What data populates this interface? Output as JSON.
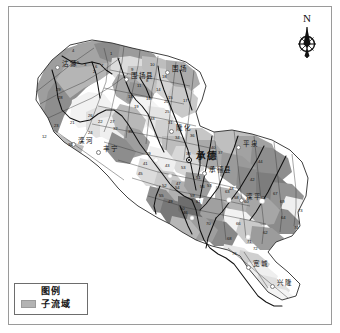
{
  "map": {
    "title_visible": false,
    "north_arrow": {
      "letter": "N",
      "icon": "compass-north-icon"
    },
    "legend": {
      "title": "图例",
      "items": [
        {
          "label": "子流域",
          "color": "#b3b3b3"
        }
      ]
    },
    "colors": {
      "frame": "#9a9a9a",
      "basin_outline": "#2b2b2b",
      "river": "#1a1a1a",
      "fill_lightest": "#ffffff",
      "fill_light": "#e2e2e2",
      "fill_mid": "#c4c4c4",
      "fill_dark": "#a6a6a6",
      "fill_darkest": "#8a8a8a"
    },
    "places": [
      {
        "name": "承德",
        "type": "city",
        "x": 196,
        "y": 148,
        "symbol": "capital-dot"
      },
      {
        "name": "围场",
        "type": "town",
        "x": 172,
        "y": 63
      },
      {
        "name": "平泉",
        "type": "town",
        "x": 243,
        "y": 138
      },
      {
        "name": "丰宁",
        "type": "town",
        "x": 103,
        "y": 143
      },
      {
        "name": "隆化",
        "type": "town",
        "x": 176,
        "y": 122
      },
      {
        "name": "滦平",
        "type": "town",
        "x": 246,
        "y": 191
      },
      {
        "name": "兴隆",
        "type": "town",
        "x": 277,
        "y": 277
      },
      {
        "name": "宽城",
        "type": "town",
        "x": 253,
        "y": 258
      },
      {
        "name": "沽源",
        "type": "town",
        "x": 62,
        "y": 58
      },
      {
        "name": "围场县",
        "type": "town",
        "x": 131,
        "y": 70
      },
      {
        "name": "承德县",
        "type": "town",
        "x": 209,
        "y": 164
      },
      {
        "name": "滦河",
        "type": "town",
        "x": 78,
        "y": 135
      }
    ],
    "subbasin_labels": [
      {
        "n": "4",
        "x": 72,
        "y": 49
      },
      {
        "n": "1",
        "x": 110,
        "y": 52
      },
      {
        "n": "5",
        "x": 77,
        "y": 61
      },
      {
        "n": "3",
        "x": 84,
        "y": 63
      },
      {
        "n": "6",
        "x": 95,
        "y": 65
      },
      {
        "n": "7",
        "x": 101,
        "y": 64
      },
      {
        "n": "2",
        "x": 93,
        "y": 70
      },
      {
        "n": "9",
        "x": 131,
        "y": 68
      },
      {
        "n": "10",
        "x": 150,
        "y": 63
      },
      {
        "n": "18",
        "x": 162,
        "y": 75
      },
      {
        "n": "8",
        "x": 146,
        "y": 79
      },
      {
        "n": "11",
        "x": 137,
        "y": 84
      },
      {
        "n": "14",
        "x": 156,
        "y": 88
      },
      {
        "n": "13",
        "x": 128,
        "y": 95
      },
      {
        "n": "15",
        "x": 168,
        "y": 96
      },
      {
        "n": "17",
        "x": 183,
        "y": 99
      },
      {
        "n": "16",
        "x": 146,
        "y": 97
      },
      {
        "n": "29",
        "x": 56,
        "y": 88
      },
      {
        "n": "28",
        "x": 58,
        "y": 96
      },
      {
        "n": "19",
        "x": 134,
        "y": 105
      },
      {
        "n": "20",
        "x": 164,
        "y": 100
      },
      {
        "n": "21",
        "x": 70,
        "y": 121
      },
      {
        "n": "23",
        "x": 54,
        "y": 124
      },
      {
        "n": "26",
        "x": 88,
        "y": 114
      },
      {
        "n": "22",
        "x": 98,
        "y": 120
      },
      {
        "n": "27",
        "x": 110,
        "y": 120
      },
      {
        "n": "24",
        "x": 88,
        "y": 131
      },
      {
        "n": "32",
        "x": 113,
        "y": 127
      },
      {
        "n": "30",
        "x": 68,
        "y": 143
      },
      {
        "n": "12",
        "x": 42,
        "y": 135
      },
      {
        "n": "33",
        "x": 150,
        "y": 117
      },
      {
        "n": "25",
        "x": 165,
        "y": 110
      },
      {
        "n": "31",
        "x": 168,
        "y": 121
      },
      {
        "n": "35",
        "x": 128,
        "y": 130
      },
      {
        "n": "34",
        "x": 175,
        "y": 136
      },
      {
        "n": "36",
        "x": 190,
        "y": 134
      },
      {
        "n": "38",
        "x": 186,
        "y": 152
      },
      {
        "n": "40",
        "x": 211,
        "y": 146
      },
      {
        "n": "37",
        "x": 218,
        "y": 151
      },
      {
        "n": "39",
        "x": 146,
        "y": 152
      },
      {
        "n": "41",
        "x": 143,
        "y": 162
      },
      {
        "n": "45",
        "x": 138,
        "y": 172
      },
      {
        "n": "43",
        "x": 165,
        "y": 164
      },
      {
        "n": "53",
        "x": 181,
        "y": 166
      },
      {
        "n": "51",
        "x": 196,
        "y": 176
      },
      {
        "n": "47",
        "x": 176,
        "y": 182
      },
      {
        "n": "52",
        "x": 162,
        "y": 184
      },
      {
        "n": "54",
        "x": 175,
        "y": 186
      },
      {
        "n": "56",
        "x": 200,
        "y": 185
      },
      {
        "n": "57",
        "x": 207,
        "y": 184
      },
      {
        "n": "59",
        "x": 190,
        "y": 194
      },
      {
        "n": "61",
        "x": 196,
        "y": 200
      },
      {
        "n": "49",
        "x": 168,
        "y": 200
      },
      {
        "n": "50",
        "x": 180,
        "y": 207
      },
      {
        "n": "46",
        "x": 183,
        "y": 211
      },
      {
        "n": "42",
        "x": 250,
        "y": 178
      },
      {
        "n": "44",
        "x": 258,
        "y": 160
      },
      {
        "n": "48",
        "x": 229,
        "y": 187
      },
      {
        "n": "58",
        "x": 234,
        "y": 196
      },
      {
        "n": "60",
        "x": 244,
        "y": 200
      },
      {
        "n": "63",
        "x": 225,
        "y": 190
      },
      {
        "n": "65",
        "x": 261,
        "y": 196
      },
      {
        "n": "67",
        "x": 273,
        "y": 192
      },
      {
        "n": "69",
        "x": 280,
        "y": 200
      },
      {
        "n": "73",
        "x": 298,
        "y": 209
      },
      {
        "n": "62",
        "x": 263,
        "y": 231
      },
      {
        "n": "64",
        "x": 281,
        "y": 216
      },
      {
        "n": "74",
        "x": 294,
        "y": 226
      },
      {
        "n": "66",
        "x": 236,
        "y": 222
      },
      {
        "n": "70",
        "x": 206,
        "y": 222
      },
      {
        "n": "68",
        "x": 227,
        "y": 237
      },
      {
        "n": "71",
        "x": 247,
        "y": 240
      },
      {
        "n": "72",
        "x": 253,
        "y": 247
      },
      {
        "n": "55",
        "x": 159,
        "y": 194
      },
      {
        "n": "76",
        "x": 232,
        "y": 252
      }
    ]
  }
}
